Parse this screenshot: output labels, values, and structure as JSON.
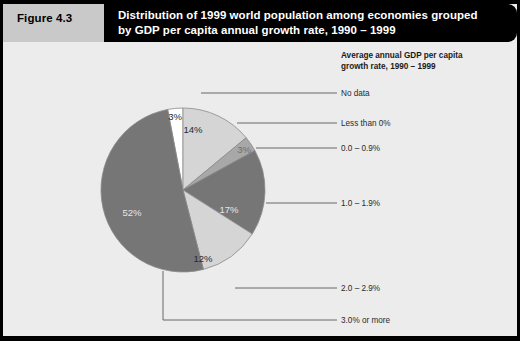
{
  "figure": {
    "tag": "Figure 4.3",
    "title_line1": "Distribution of 1999 world population among economies grouped",
    "title_line2": "by GDP per capita annual growth rate, 1990 – 1999"
  },
  "legend": {
    "heading_line1": "Average annual GDP per capita",
    "heading_line2": "growth rate, 1990 – 1999"
  },
  "colors": {
    "page_background": "#ececec",
    "frame": "#000000",
    "figure_tag_background": "#c9c9c9",
    "title_background": "#000000",
    "title_text": "#ffffff",
    "slice_no_data": "#ffffff",
    "slice_light": "#d5d5d5",
    "slice_medium": "#a8a8a8",
    "slice_dark": "#767676",
    "leader_line": "#5a5a5a",
    "slice_outline": "#8a8a8a"
  },
  "chart_data": {
    "type": "pie",
    "title": "Distribution of 1999 world population among economies grouped by GDP per capita annual growth rate, 1990 – 1999",
    "legend_title": "Average annual GDP per capita growth rate, 1990 – 1999",
    "legend_position": "right",
    "unit": "percent of 1999 world population",
    "categories": [
      "No data",
      "Less than 0%",
      "0.0 – 0.9%",
      "1.0 – 1.9%",
      "2.0 – 2.9%",
      "3.0% or more"
    ],
    "values": [
      3,
      14,
      3,
      17,
      12,
      52
    ],
    "labels": [
      "3%",
      "14%",
      "3%",
      "17%",
      "12%",
      "52%"
    ],
    "slices": [
      {
        "category": "No data",
        "value": 3,
        "label": "3%",
        "fill": "#ffffff",
        "start_angle": 349.2,
        "end_angle": 360.0,
        "label_x": 175,
        "label_y": 120,
        "label_color": "#2a2a2a",
        "leader": {
          "from_x": 201,
          "from_y": 93,
          "to_x": 337,
          "to_y": 93,
          "text_x": 341,
          "text_y": 89
        }
      },
      {
        "category": "Less than 0%",
        "value": 14,
        "label": "14%",
        "fill": "#d5d5d5",
        "start_angle": 0.0,
        "end_angle": 50.4,
        "label_x": 193,
        "label_y": 133,
        "label_color": "#2a2a2a",
        "leader": {
          "from_x": 237,
          "from_y": 123,
          "to_x": 337,
          "to_y": 123,
          "text_x": 341,
          "text_y": 119
        }
      },
      {
        "category": "0.0 – 0.9%",
        "value": 3,
        "label": "3%",
        "fill": "#a8a8a8",
        "start_angle": 50.4,
        "end_angle": 61.2,
        "label_x": 244,
        "label_y": 153,
        "label_color": "#6e6e6e",
        "leader": {
          "from_x": 256,
          "from_y": 148,
          "to_x": 337,
          "to_y": 148,
          "text_x": 341,
          "text_y": 144
        }
      },
      {
        "category": "1.0 – 1.9%",
        "value": 17,
        "label": "17%",
        "fill": "#767676",
        "start_angle": 61.2,
        "end_angle": 122.4,
        "label_x": 229,
        "label_y": 213,
        "label_color": "#e6e6e6",
        "leader": {
          "from_x": 266,
          "from_y": 203,
          "to_x": 337,
          "to_y": 203,
          "text_x": 341,
          "text_y": 199
        }
      },
      {
        "category": "2.0 – 2.9%",
        "value": 12,
        "label": "12%",
        "fill": "#d5d5d5",
        "start_angle": 122.4,
        "end_angle": 165.6,
        "label_x": 203,
        "label_y": 262,
        "label_color": "#2a2a2a",
        "leader": {
          "from_x": 235,
          "from_y": 288,
          "to_x": 337,
          "to_y": 288,
          "text_x": 341,
          "text_y": 284
        }
      },
      {
        "category": "3.0% or more",
        "value": 52,
        "label": "52%",
        "fill": "#767676",
        "start_angle": 165.6,
        "end_angle": 349.2,
        "label_x": 132,
        "label_y": 216,
        "label_color": "#e6e6e6",
        "leader": {
          "from_x": 163,
          "from_y": 320,
          "to_x": 337,
          "to_y": 320,
          "text_x": 341,
          "text_y": 316,
          "elbow_y": 271
        }
      }
    ],
    "geometry": {
      "cx": 183,
      "cy": 190,
      "r": 82
    }
  }
}
